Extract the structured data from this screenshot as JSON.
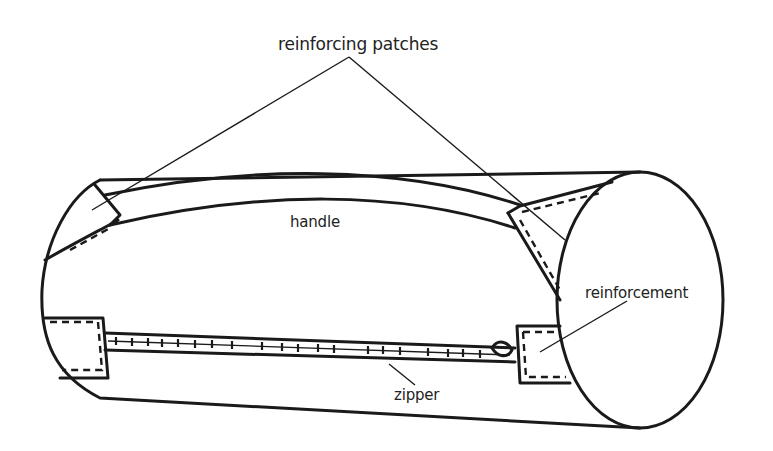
{
  "diagram": {
    "colors": {
      "line": "#1a1a1a",
      "background": "#ffffff",
      "text": "#222222"
    },
    "labels": {
      "reinforcing_patches": "reinforcing patches",
      "handle": "handle",
      "reinforcement": "reinforcement",
      "zipper": "zipper"
    }
  }
}
